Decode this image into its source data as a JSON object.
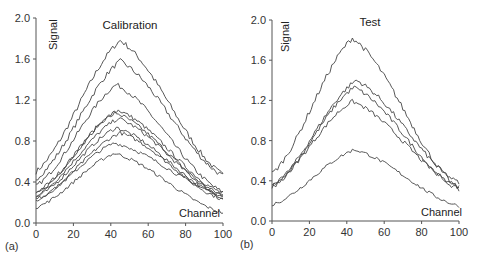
{
  "chart_data": [
    {
      "type": "line",
      "panel_label": "(a)",
      "title": "Calibration",
      "xlabel": "Channel",
      "ylabel": "Signal",
      "xlim": [
        0,
        100
      ],
      "ylim": [
        0.0,
        2.0
      ],
      "xticks": [
        0,
        20,
        40,
        60,
        80,
        100
      ],
      "yticks": [
        0.0,
        0.4,
        0.8,
        1.2,
        1.6,
        2.0
      ],
      "ytick_labels": [
        "0.0",
        "0.4",
        "0.8",
        "1.2",
        "1.6",
        "2.0"
      ],
      "grid": false,
      "legend": null,
      "series": [
        {
          "name": "cal-1",
          "start": 0.5,
          "peak": 1.78,
          "peak_x": 45,
          "end": 0.47
        },
        {
          "name": "cal-2",
          "start": 0.43,
          "peak": 1.58,
          "peak_x": 45,
          "end": 0.46
        },
        {
          "name": "cal-3",
          "start": 0.36,
          "peak": 1.35,
          "peak_x": 43,
          "end": 0.3
        },
        {
          "name": "cal-4",
          "start": 0.3,
          "peak": 1.1,
          "peak_x": 44,
          "end": 0.29
        },
        {
          "name": "cal-5",
          "start": 0.28,
          "peak": 1.08,
          "peak_x": 42,
          "end": 0.27
        },
        {
          "name": "cal-6",
          "start": 0.27,
          "peak": 1.02,
          "peak_x": 44,
          "end": 0.26
        },
        {
          "name": "cal-7",
          "start": 0.25,
          "peak": 0.93,
          "peak_x": 43,
          "end": 0.25
        },
        {
          "name": "cal-8",
          "start": 0.22,
          "peak": 0.88,
          "peak_x": 45,
          "end": 0.23
        },
        {
          "name": "cal-9",
          "start": 0.23,
          "peak": 0.78,
          "peak_x": 42,
          "end": 0.27
        },
        {
          "name": "cal-10",
          "start": 0.15,
          "peak": 0.68,
          "peak_x": 42,
          "end": 0.1
        }
      ]
    },
    {
      "type": "line",
      "panel_label": "(b)",
      "title": "Test",
      "xlabel": "Channel",
      "ylabel": "Signal",
      "xlim": [
        0,
        100
      ],
      "ylim": [
        0.0,
        2.0
      ],
      "xticks": [
        0,
        20,
        40,
        60,
        80,
        100
      ],
      "yticks": [
        0.0,
        0.4,
        0.8,
        1.2,
        1.6,
        2.0
      ],
      "ytick_labels": [
        "0.0",
        "0.4",
        "0.8",
        "1.2",
        "1.6",
        "2.0"
      ],
      "grid": false,
      "legend": null,
      "series": [
        {
          "name": "test-1",
          "start": 0.47,
          "peak": 1.82,
          "peak_x": 43,
          "end": 0.32
        },
        {
          "name": "test-2",
          "start": 0.34,
          "peak": 1.4,
          "peak_x": 45,
          "end": 0.38
        },
        {
          "name": "test-3",
          "start": 0.33,
          "peak": 1.33,
          "peak_x": 44,
          "end": 0.31
        },
        {
          "name": "test-4",
          "start": 0.36,
          "peak": 1.19,
          "peak_x": 43,
          "end": 0.34
        },
        {
          "name": "test-5",
          "start": 0.16,
          "peak": 0.71,
          "peak_x": 44,
          "end": 0.15
        }
      ]
    }
  ],
  "panels": [
    {
      "label": "(a)",
      "title": "Calibration",
      "xlabel": "Channel",
      "ylabel": "Signal"
    },
    {
      "label": "(b)",
      "title": "Test",
      "xlabel": "Channel",
      "ylabel": "Signal"
    }
  ]
}
